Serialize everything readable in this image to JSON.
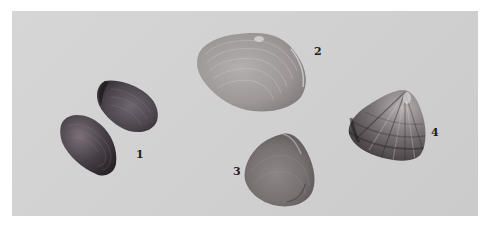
{
  "image": {
    "description": "Photograph of four numbered bivalve shell specimens on a light gray background",
    "background_color": "#d2d2d2",
    "page_background": "#ffffff"
  },
  "specimens": [
    {
      "label": "1",
      "count": 2,
      "tone": "dark brown-gray",
      "shape": "oval, pair of valves"
    },
    {
      "label": "2",
      "count": 1,
      "tone": "pale gray",
      "shape": "large ovate with concentric growth lines"
    },
    {
      "label": "3",
      "count": 1,
      "tone": "medium gray",
      "shape": "rounded triangular"
    },
    {
      "label": "4",
      "count": 1,
      "tone": "mottled dark with light rays",
      "shape": "triangular, radially striped"
    }
  ]
}
